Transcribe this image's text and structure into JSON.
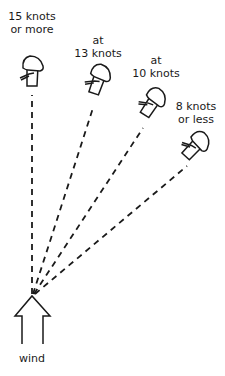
{
  "diagram": {
    "type": "sailing-wind-angles",
    "colors": {
      "ink": "#1a1a1a",
      "background": "#ffffff"
    },
    "wind_label": "wind",
    "boats": [
      {
        "id": "boat-15",
        "label_line1": "15 knots",
        "label_line2": "or more"
      },
      {
        "id": "boat-13",
        "label_line1": "at",
        "label_line2": "13 knots"
      },
      {
        "id": "boat-10",
        "label_line1": "at",
        "label_line2": "10 knots"
      },
      {
        "id": "boat-8",
        "label_line1": "8 knots",
        "label_line2": "or less"
      }
    ]
  }
}
